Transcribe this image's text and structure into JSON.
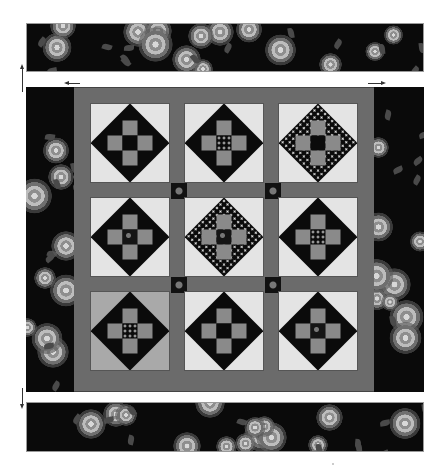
{
  "figure": {
    "layout": {
      "block_grid": {
        "rows": 3,
        "columns": 3
      },
      "block_pattern": "nine-patch on point (diamond in a square)",
      "sashing_color": "#6b6b6b",
      "cornerstone_fabric": "dark floral"
    },
    "blocks": [
      {
        "row": 1,
        "col": 1,
        "background": "light",
        "diamond": "dark print with dotted corners",
        "center": "dark"
      },
      {
        "row": 1,
        "col": 2,
        "background": "light",
        "diamond": "dark print",
        "center": "dotted"
      },
      {
        "row": 1,
        "col": 3,
        "background": "light",
        "diamond": "dotted with print corners",
        "center": "dark"
      },
      {
        "row": 2,
        "col": 1,
        "background": "light",
        "diamond": "dark print with dotted corners",
        "center": "floral print"
      },
      {
        "row": 2,
        "col": 2,
        "background": "light",
        "diamond": "dotted",
        "center": "small floral"
      },
      {
        "row": 2,
        "col": 3,
        "background": "light",
        "diamond": "dark print",
        "center": "dotted"
      },
      {
        "row": 3,
        "col": 1,
        "background": "grey",
        "diamond": "dark with small flowers",
        "center": "dotted"
      },
      {
        "row": 3,
        "col": 2,
        "background": "light",
        "diamond": "dark print with dotted corners",
        "center": "dark"
      },
      {
        "row": 3,
        "col": 3,
        "background": "light",
        "diamond": "dark with small flowers",
        "center": "floral print"
      }
    ],
    "borders": {
      "top": "black rose floral strip",
      "bottom": "black rose floral strip",
      "left": "black rose floral panel",
      "right": "black rose floral panel"
    },
    "arrows": [
      {
        "name": "top-border-arrow",
        "direction": "up"
      },
      {
        "name": "left-side-arrow",
        "direction": "left"
      },
      {
        "name": "right-side-arrow",
        "direction": "right"
      },
      {
        "name": "bottom-border-arrow",
        "direction": "down"
      }
    ],
    "colors": {
      "background": "#ffffff",
      "floral_ground": "#0a0a0a",
      "block_light": "#e4e4e4",
      "block_grey": "#a9a9a9",
      "patch_grey": "#8a8a8a"
    }
  }
}
